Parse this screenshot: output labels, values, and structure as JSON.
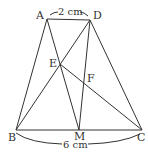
{
  "diagram": {
    "type": "geometry-trapezoid",
    "points": {
      "A": {
        "label": "A",
        "x": 47,
        "y": 19
      },
      "D": {
        "label": "D",
        "x": 90,
        "y": 20
      },
      "B": {
        "label": "B",
        "x": 16,
        "y": 130
      },
      "C": {
        "label": "C",
        "x": 142,
        "y": 130
      },
      "M": {
        "label": "M",
        "x": 79,
        "y": 130
      },
      "E": {
        "label": "E",
        "x": 60,
        "y": 64
      },
      "F": {
        "label": "F",
        "x": 85,
        "y": 83
      }
    },
    "segments": [
      "AD",
      "AB",
      "DC",
      "BC",
      "AM",
      "DB",
      "DM",
      "EC"
    ],
    "dimensions": {
      "top": "2 cm",
      "bottom": "6 cm"
    },
    "colors": {
      "line": "#333333",
      "background": "#ffffff"
    }
  }
}
